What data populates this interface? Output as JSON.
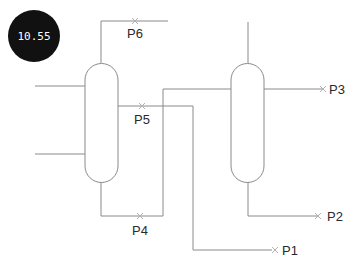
{
  "badge": {
    "value": "10.55",
    "color": "#111111",
    "text_color": "#ffffff"
  },
  "diagram": {
    "type": "process-flow",
    "vessels": [
      {
        "id": "vessel-1"
      },
      {
        "id": "vessel-2"
      }
    ],
    "streams": [
      {
        "id": "P1",
        "label": "P1"
      },
      {
        "id": "P2",
        "label": "P2"
      },
      {
        "id": "P3",
        "label": "P3"
      },
      {
        "id": "P4",
        "label": "P4"
      },
      {
        "id": "P5",
        "label": "P5"
      },
      {
        "id": "P6",
        "label": "P6"
      }
    ],
    "line_color": "#8a8a8a"
  }
}
